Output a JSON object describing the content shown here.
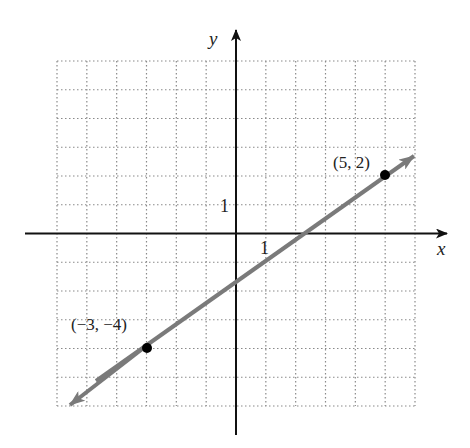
{
  "chart_data": {
    "type": "line",
    "title": "",
    "xlabel": "x",
    "ylabel": "y",
    "xlim": [
      -6,
      6
    ],
    "ylim": [
      -6,
      6
    ],
    "grid": true,
    "grid_style": "dotted",
    "tick_labels": {
      "x": "1",
      "y": "1"
    },
    "points": [
      {
        "x": -3,
        "y": -4,
        "label": "(−3, −4)"
      },
      {
        "x": 5,
        "y": 2,
        "label": "(5, 2)"
      }
    ],
    "line": {
      "slope": 0.75,
      "intercept": -1.75,
      "arrows": "both",
      "color": "#7a7a7a"
    },
    "point_color": "#000000",
    "axis_color": "#111111",
    "grid_color": "#8a8a8a"
  },
  "labels": {
    "x_axis": "x",
    "y_axis": "y",
    "x_tick": "1",
    "y_tick": "1",
    "point_a": "(−3, −4)",
    "point_b": "(5, 2)"
  }
}
